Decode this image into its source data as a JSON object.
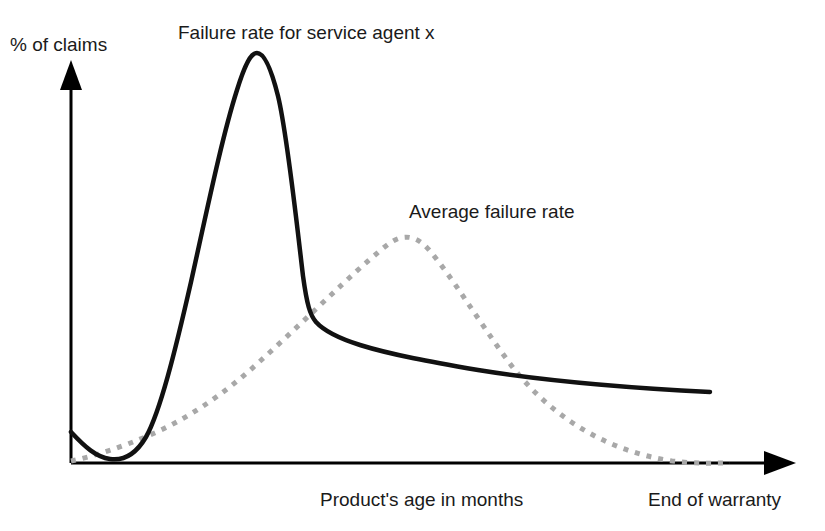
{
  "figure": {
    "width": 825,
    "height": 531,
    "background": "#ffffff"
  },
  "labels": {
    "y_axis": "% of claims",
    "series_solid_title": "Failure rate for service agent x",
    "series_dashed_title": "Average failure rate",
    "x_axis": "Product's age in months",
    "x_axis_end": "End of warranty"
  },
  "colors": {
    "axis": "#000000",
    "solid_curve": "#111111",
    "dashed_curve": "#a8a8a8",
    "text": "#1a1a1a",
    "background": "#ffffff"
  },
  "chart_data": {
    "type": "line",
    "title": "Failure rate for service agent x",
    "xlabel": "Product's age in months",
    "ylabel": "% of claims",
    "grid": false,
    "axes_style": "arrowed-open-axes",
    "tick_labels": {
      "x": [
        "Product's age in months",
        "End of warranty"
      ],
      "y": []
    },
    "xlim": [
      0,
      100
    ],
    "ylim": [
      0,
      100
    ],
    "legend_position": "inline-annotations",
    "annotations": [
      {
        "text": "Failure rate for service agent x",
        "target_series": "Failure rate for service agent x",
        "x": 29,
        "y": 104
      },
      {
        "text": "Average failure rate",
        "target_series": "Average failure rate",
        "x": 47,
        "y": 63
      },
      {
        "text": "End of warranty",
        "target_series": "Average failure rate",
        "x": 91,
        "y": 0
      }
    ],
    "series": [
      {
        "name": "Failure rate for service agent x",
        "style": "solid",
        "color": "#111111",
        "width": 4,
        "description": "Bathtub-shaped early-life failure curve with a very tall narrow infant-mortality spike, then a long slowly declining tail",
        "x": [
          0,
          3,
          5,
          8,
          11,
          14,
          17,
          20,
          23,
          25.5,
          26,
          27,
          29,
          32,
          36,
          40,
          46,
          52,
          60,
          68,
          76,
          84,
          88
        ],
        "y": [
          7.6,
          3.0,
          1.0,
          0.4,
          1.2,
          5.0,
          16.0,
          44.0,
          82.0,
          99.0,
          100.0,
          92.0,
          62.0,
          36.0,
          30.0,
          27.0,
          24.5,
          22.0,
          19.5,
          17.5,
          16.0,
          15.0,
          17.5
        ]
      },
      {
        "name": "Average failure rate",
        "style": "dashed",
        "color": "#a8a8a8",
        "width": 4,
        "dash_pattern": "5 7",
        "description": "Broad smooth hump peaking near mid-warranty and decaying to zero at end of warranty",
        "x": [
          0,
          5,
          10,
          15,
          20,
          25,
          30,
          35,
          40,
          45,
          50,
          55,
          60,
          65,
          70,
          75,
          80,
          85,
          90
        ],
        "y": [
          0.5,
          3.0,
          7.0,
          13.0,
          21.0,
          32.0,
          43.0,
          51.5,
          55.0,
          54.0,
          50.0,
          44.0,
          37.0,
          30.0,
          23.0,
          16.0,
          10.0,
          4.5,
          0.0
        ]
      }
    ]
  },
  "geometry": {
    "axis_origin": {
      "x": 71,
      "y": 463
    },
    "y_axis_top": {
      "x": 71,
      "y": 63
    },
    "x_axis_end": {
      "x": 795,
      "y": 463
    },
    "solid_path": "M71,432 C85,447 96,457 110,459 C124,461 136,454 146,437 C160,412 175,352 191,282 C207,210 222,137 237,90 C245,64 251,53 257,53 C264,53 271,68 278,96 C287,133 296,217 303,276 C307,305 310,315 316,322 C325,332 341,339 360,345 C392,355 432,362 478,370 C540,380 630,388 710,392",
    "dashed_path": "M71,461 C95,456 122,447 150,435 C185,420 222,396 258,363 C296,329 336,289 368,261 C381,250 390,241 400,238 C411,235 421,240 430,251 C452,277 478,320 508,361 C545,411 600,450 672,461 C698,464 714,463 730,463"
  }
}
